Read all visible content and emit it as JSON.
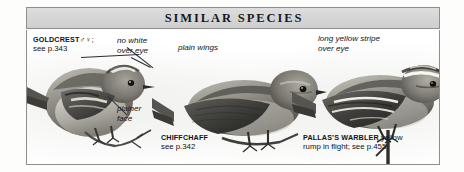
{
  "panel": {
    "header_title": "SIMILAR  SPECIES",
    "border_color": "#8e8e8e",
    "header_bg": "#d6d6d6",
    "background": "#ffffff"
  },
  "species": [
    {
      "id": "goldcrest",
      "name": "GOLDCREST",
      "symbols": "♂♀",
      "punct": ";",
      "page_ref": "see p.343",
      "tail": ""
    },
    {
      "id": "chiffchaff",
      "name": "CHIFFCHAFF",
      "symbols": "",
      "punct": "",
      "page_ref": "see p.342",
      "tail": ""
    },
    {
      "id": "pallass-warbler",
      "name": "PALLAS’S WARBLER",
      "symbols": "",
      "punct": "",
      "page_ref": "rump in flight; see p.455",
      "tail": "yellow"
    }
  ],
  "annotations": [
    {
      "id": "no-white-over-eye",
      "line1": "no white",
      "line2": "over eye"
    },
    {
      "id": "plain-wings",
      "line1": "plain wings",
      "line2": ""
    },
    {
      "id": "long-yellow-stripe",
      "line1": "long yellow stripe",
      "line2": "over eye"
    },
    {
      "id": "plainer-face",
      "line1": "plainer",
      "line2": "face"
    }
  ]
}
